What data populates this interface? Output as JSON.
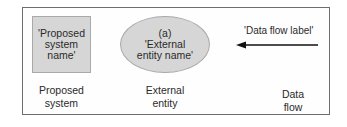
{
  "diagram": {
    "symbols": [
      {
        "shape": "rectangle",
        "text_lines": [
          "'Proposed",
          "system",
          "name'"
        ],
        "caption_lines": [
          "Proposed",
          "system"
        ]
      },
      {
        "shape": "ellipse",
        "text_lines": [
          "(a)",
          "'External",
          "entity name'"
        ],
        "caption_lines": [
          "External",
          "entity"
        ]
      },
      {
        "shape": "arrow-left",
        "text": "'Data flow label'",
        "caption_lines": [
          "Data",
          "flow"
        ]
      }
    ],
    "colors": {
      "fill": "#d6d6d6",
      "border": "#6e6e6e",
      "arrow": "#111111"
    }
  }
}
